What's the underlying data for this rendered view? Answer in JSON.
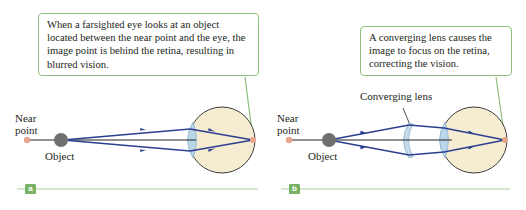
{
  "panels": [
    {
      "id": "a",
      "tag": "a",
      "callout": "When a farsighted eye looks at an object located between the near point and the eye, the image point is behind the retina, resulting in blurred vision.",
      "near_point_label_1": "Near",
      "near_point_label_2": "point",
      "object_label": "Object"
    },
    {
      "id": "b",
      "tag": "b",
      "callout": "A converging lens causes the image to focus on the retina, correcting the vision.",
      "near_point_label_1": "Near",
      "near_point_label_2": "point",
      "object_label": "Object",
      "lens_label": "Converging lens"
    }
  ],
  "colors": {
    "callout_border": "#8dbf7e",
    "tag_fill": "#7ab265",
    "ray": "#2b3f8f",
    "eye_fill": "#f6ecd2",
    "lens_fill": "#b9d6e8",
    "near_point": "#e8a48c",
    "object": "#707070"
  }
}
